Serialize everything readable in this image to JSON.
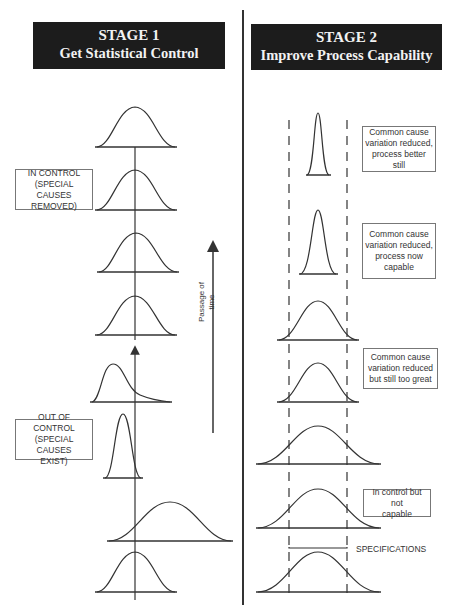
{
  "stage1": {
    "title": "STAGE 1",
    "subtitle": "Get Statistical Control",
    "labels": {
      "in_control": [
        "IN CONTROL",
        "(SPECIAL CAUSES",
        "REMOVED)"
      ],
      "out_of_control": [
        "OUT OF CONTROL",
        "(SPECIAL CAUSES",
        "EXIST)"
      ]
    },
    "arrow_label": [
      "Passage of",
      "time"
    ],
    "distributions_top_to_bottom": [
      "normal, centered (in control)",
      "normal, centered (in control)",
      "normal, centered (in control)",
      "normal, centered (in control)",
      "skewed, shifted left",
      "narrow, shifted left",
      "wide, shifted right",
      "normal, centered"
    ]
  },
  "stage2": {
    "title": "STAGE 2",
    "subtitle": "Improve Process Capability",
    "labels": {
      "better_still": [
        "Common cause",
        "variation reduced,",
        "process better still"
      ],
      "now_capable": [
        "Common cause",
        "variation reduced,",
        "process now",
        "capable"
      ],
      "still_too_great": [
        "Common cause",
        "variation reduced",
        "but still too great"
      ],
      "not_capable": [
        "In control but not",
        "capable"
      ],
      "specifications": "SPECIFICATIONS"
    },
    "distributions_top_to_bottom": [
      "very narrow, within specs",
      "narrow, within specs",
      "medium, slightly exceeds specs",
      "medium, slightly exceeds specs",
      "wide, exceeds specs",
      "wide, exceeds specs",
      "wide, exceeds specs"
    ]
  },
  "colors": {
    "banner_bg": "#1c1c1c",
    "banner_text": "#f2f2f2",
    "line": "#333333"
  }
}
